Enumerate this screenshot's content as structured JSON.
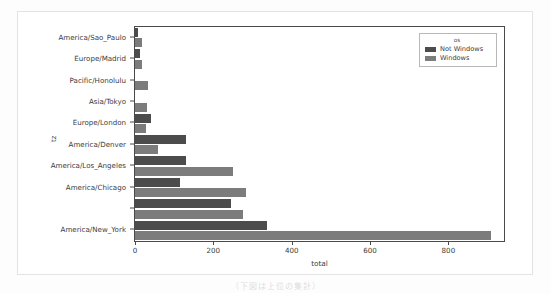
{
  "figure": {
    "ylabel": "tz",
    "xlabel": "total",
    "caption": "（下図は上位の集計）"
  },
  "legend": {
    "title": "os",
    "entries": [
      {
        "label": "Not Windows",
        "color": "#4c4c4c"
      },
      {
        "label": "Windows",
        "color": "#7c7c7c"
      }
    ]
  },
  "chart_data": {
    "type": "bar",
    "orientation": "horizontal",
    "title": "",
    "xlabel": "total",
    "ylabel": "tz",
    "xlim": [
      0,
      942
    ],
    "xticks": [
      0,
      200,
      400,
      600,
      800
    ],
    "grid": false,
    "legend_position": "upper right",
    "legend_title": "os",
    "categories": [
      "America/Sao_Paulo",
      "Europe/Madrid",
      "Pacific/Honolulu",
      "Asia/Tokyo",
      "Europe/London",
      "America/Denver",
      "America/Los_Angeles",
      "America/Chicago",
      "",
      "America/New_York"
    ],
    "series": [
      {
        "name": "Not Windows",
        "color": "#4c4c4c",
        "values": [
          8,
          12,
          0,
          0,
          42,
          130,
          130,
          115,
          245,
          338
        ]
      },
      {
        "name": "Windows",
        "color": "#7c7c7c",
        "values": [
          18,
          18,
          32,
          30,
          28,
          58,
          250,
          283,
          275,
          910
        ]
      }
    ]
  }
}
